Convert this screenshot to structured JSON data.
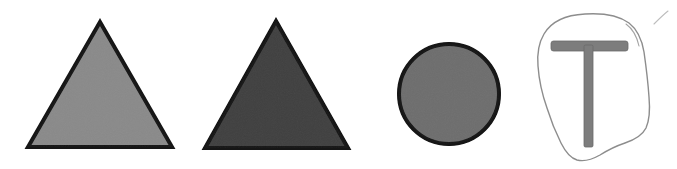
{
  "figure": {
    "width": 677,
    "height": 169,
    "background_color": "#ffffff",
    "outline_color": "#111111",
    "sketch_outline_color": "#8d8d8d"
  },
  "shapes": [
    {
      "id": "triangle-light",
      "name": "light-gray-triangle",
      "type": "triangle",
      "label": "Light gray equilateral triangle",
      "fill_color": "#8a8a8a",
      "stroke_color": "#141414",
      "stroke_width": 4,
      "apex": {
        "x": 100,
        "y": 22
      },
      "base_left": {
        "x": 28,
        "y": 147
      },
      "base_right": {
        "x": 172,
        "y": 147
      },
      "points": "100,22 172,147 28,147"
    },
    {
      "id": "triangle-dark",
      "name": "dark-gray-triangle",
      "type": "triangle",
      "label": "Dark gray equilateral triangle",
      "fill_color": "#3f3f3f",
      "stroke_color": "#121212",
      "stroke_width": 4,
      "apex": {
        "x": 276,
        "y": 21
      },
      "base_left": {
        "x": 205,
        "y": 148
      },
      "base_right": {
        "x": 348,
        "y": 148
      },
      "points": "276,21 348,148 205,148"
    },
    {
      "id": "circle-medium",
      "name": "medium-gray-circle",
      "type": "circle",
      "label": "Medium gray filled circle",
      "fill_color": "#6e6e6e",
      "stroke_color": "#131313",
      "stroke_width": 4,
      "center": {
        "x": 449,
        "y": 94
      },
      "radius": 50
    },
    {
      "id": "blob-sketch",
      "name": "hand-drawn-blob",
      "type": "freeform",
      "label": "Hand drawn irregular outline (pencil sketch)",
      "fill_color": "#ffffff",
      "stroke_color": "#8d8d8d",
      "stroke_width": 1.4,
      "path": "M 585 14 C 565 15, 551 22, 544 34 C 538 44, 537 54, 538 66 C 539 80, 542 94, 547 108 C 551 121, 556 133, 561 143 C 565 151, 570 158, 577 160 C 585 162, 593 159, 600 155 C 608 150, 616 146, 625 143 C 634 140, 642 136, 646 128 C 650 119, 650 108, 649 97 C 648 82, 646 66, 644 52 C 642 40, 638 30, 629 23 C 618 15, 601 13, 585 14 Z"
    },
    {
      "id": "t-glyph",
      "name": "gray-t-shape",
      "type": "letter-t",
      "label": "Gray T shape inside the blob",
      "fill_color": "#7d7d7d",
      "stroke_color": "#6a6a6a",
      "bar": {
        "x": 551,
        "y": 41,
        "width": 77,
        "height": 10
      },
      "stem": {
        "x": 584,
        "y": 45,
        "width": 9,
        "height": 102
      }
    },
    {
      "id": "stray-mark",
      "name": "stray-pencil-mark",
      "type": "stroke",
      "label": "Faint diagonal stray pencil mark",
      "stroke_color": "#bdbdbd",
      "stroke_width": 1.1,
      "path": "M 654 24 C 658 20, 663 15, 668 11"
    }
  ]
}
